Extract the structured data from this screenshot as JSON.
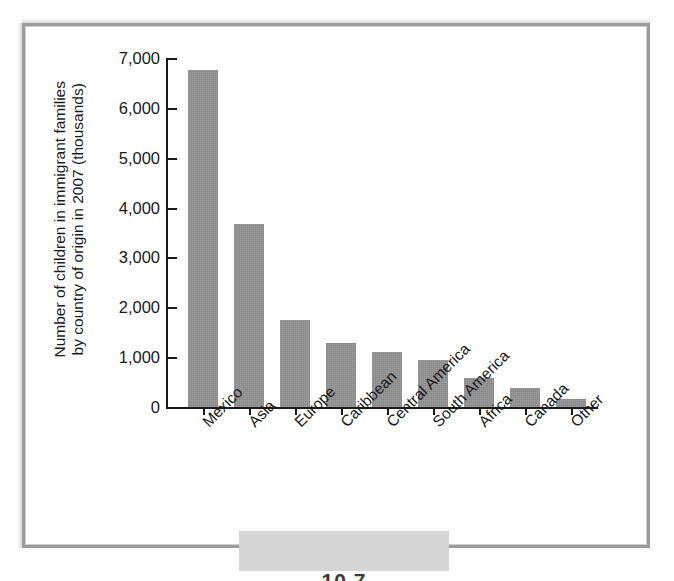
{
  "figure": {
    "caption_partial": "10.7"
  },
  "chart_data": {
    "type": "bar",
    "title": "",
    "xlabel": "",
    "ylabel_lines": [
      "Number of children in immigrant families",
      "by country of origin in 2007 (thousands)"
    ],
    "ylabel": "Number of children in immigrant families by country of origin in 2007 (thousands)",
    "categories": [
      "Mexico",
      "Asia",
      "Europe",
      "Caribbean",
      "Central America",
      "South America",
      "Africa",
      "Canada",
      "Other"
    ],
    "values": [
      6760,
      3670,
      1750,
      1280,
      1100,
      950,
      580,
      390,
      160
    ],
    "ylim": [
      0,
      7000
    ],
    "ytick_values": [
      0,
      1000,
      2000,
      3000,
      4000,
      5000,
      6000,
      7000
    ],
    "ytick_labels": [
      "0",
      "1,000",
      "2,000",
      "3,000",
      "4,000",
      "5,000",
      "6,000",
      "7,000"
    ],
    "grid": false,
    "legend": null,
    "bar_color": "#929292",
    "axis_color": "#1a1a1a",
    "frame_color": "#9b9b9b"
  }
}
